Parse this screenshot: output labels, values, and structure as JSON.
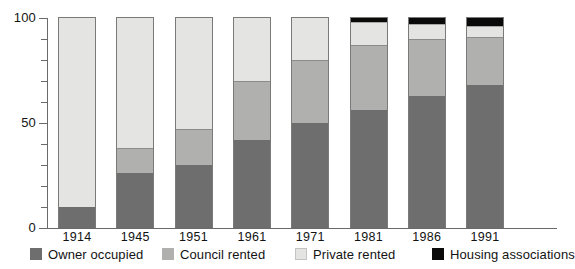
{
  "chart_data": {
    "type": "bar",
    "stacked": true,
    "title": "",
    "subtitle": "",
    "xlabel": "",
    "ylabel": "",
    "ylim": [
      0,
      100
    ],
    "ytick_labels": [
      "0",
      "50",
      "100"
    ],
    "ytick_values": [
      0,
      50,
      100
    ],
    "yminor_step": 10,
    "grid": false,
    "legend_position": "bottom",
    "categories": [
      "1914",
      "1945",
      "1951",
      "1961",
      "1971",
      "1981",
      "1986",
      "1991"
    ],
    "series": [
      {
        "name": "Owner occupied",
        "color": "#6e6e6e",
        "values": [
          10,
          26,
          30,
          42,
          50,
          56,
          63,
          68
        ]
      },
      {
        "name": "Council rented",
        "color": "#b0b0ae",
        "values": [
          0,
          12,
          17,
          28,
          30,
          31,
          27,
          23
        ]
      },
      {
        "name": "Private rented",
        "color": "#e4e4e2",
        "values": [
          90,
          62,
          53,
          30,
          20,
          11,
          7,
          5
        ]
      },
      {
        "name": "Housing associations",
        "color": "#0a0a0a",
        "values": [
          0,
          0,
          0,
          0,
          0,
          2,
          3,
          4
        ]
      }
    ]
  },
  "legend": {
    "items": [
      {
        "label": "Owner occupied"
      },
      {
        "label": "Council rented"
      },
      {
        "label": "Private rented"
      },
      {
        "label": "Housing associations"
      }
    ]
  }
}
